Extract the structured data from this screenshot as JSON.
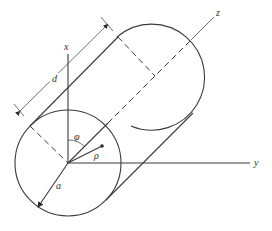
{
  "diagram": {
    "type": "cylinder-coordinate-geometry",
    "labels": {
      "x_axis": "x",
      "y_axis": "y",
      "z_axis": "z",
      "length": "d",
      "angle": "φ",
      "radial": "ρ",
      "radius": "a"
    },
    "colors": {
      "line": "#3a3a3a",
      "background": "#ffffff"
    }
  }
}
